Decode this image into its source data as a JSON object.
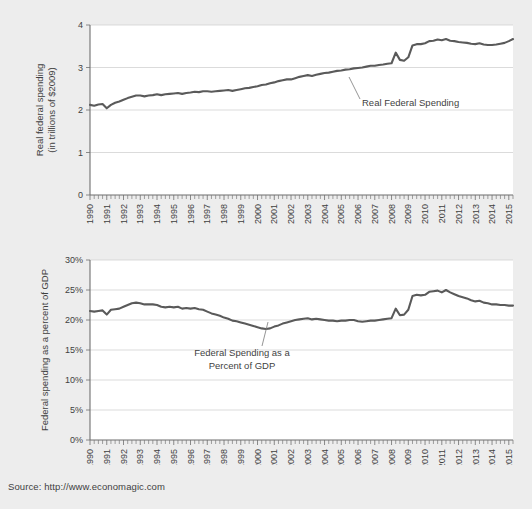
{
  "source": {
    "label": "Source: http://www.economagic.com"
  },
  "charts": [
    {
      "id": "real-federal-spending",
      "ylabel_line1": "Real federal spending",
      "ylabel_line2": "(in trillions of $2009)",
      "annotation_line1": "Real Federal Spending",
      "annotation_line2": "",
      "yticks": [
        "0",
        "1",
        "2",
        "3",
        "4"
      ],
      "xticks": [
        "1990",
        "1991",
        "1992",
        "1993",
        "1994",
        "1995",
        "1996",
        "1997",
        "1998",
        "1999",
        "2000",
        "2001",
        "2002",
        "2003",
        "2004",
        "2005",
        "2006",
        "2007",
        "2008",
        "2009",
        "2010",
        "2011",
        "2012",
        "2013",
        "2014",
        "2015"
      ]
    },
    {
      "id": "federal-spending-pct-gdp",
      "ylabel_line1": "Federal spending as a percent of GDP",
      "ylabel_line2": "",
      "annotation_line1": "Federal Spending as a",
      "annotation_line2": "Percent of GDP",
      "yticks": [
        "0%",
        "5%",
        "10%",
        "15%",
        "20%",
        "25%",
        "30%"
      ],
      "xticks": [
        "1990",
        "1991",
        "1992",
        "1993",
        "1994",
        "1995",
        "1996",
        "1997",
        "1998",
        "1999",
        "2000",
        "2001",
        "2002",
        "2003",
        "2004",
        "2005",
        "2006",
        "2007",
        "2008",
        "2009",
        "2010",
        "2011",
        "2012",
        "2013",
        "2014",
        "2015"
      ]
    }
  ],
  "chart_data": [
    {
      "type": "line",
      "title": "",
      "xlabel": "",
      "ylabel": "Real federal spending (in trillions of $2009)",
      "xlim": [
        1990,
        2015.25
      ],
      "ylim": [
        0,
        4
      ],
      "grid": true,
      "legend": "none",
      "annotations": [
        {
          "text": "Real Federal Spending",
          "x": 2006.0,
          "y": 2.52
        }
      ],
      "series": [
        {
          "name": "Real Federal Spending",
          "color": "#5a5a5a",
          "x": [
            1990.0,
            1990.25,
            1990.5,
            1990.75,
            1991.0,
            1991.25,
            1991.5,
            1991.75,
            1992.0,
            1992.25,
            1992.5,
            1992.75,
            1993.0,
            1993.25,
            1993.5,
            1993.75,
            1994.0,
            1994.25,
            1994.5,
            1994.75,
            1995.0,
            1995.25,
            1995.5,
            1995.75,
            1996.0,
            1996.25,
            1996.5,
            1996.75,
            1997.0,
            1997.25,
            1997.5,
            1997.75,
            1998.0,
            1998.25,
            1998.5,
            1998.75,
            1999.0,
            1999.25,
            1999.5,
            1999.75,
            2000.0,
            2000.25,
            2000.5,
            2000.75,
            2001.0,
            2001.25,
            2001.5,
            2001.75,
            2002.0,
            2002.25,
            2002.5,
            2002.75,
            2003.0,
            2003.25,
            2003.5,
            2003.75,
            2004.0,
            2004.25,
            2004.5,
            2004.75,
            2005.0,
            2005.25,
            2005.5,
            2005.75,
            2006.0,
            2006.25,
            2006.5,
            2006.75,
            2007.0,
            2007.25,
            2007.5,
            2007.75,
            2008.0,
            2008.25,
            2008.5,
            2008.75,
            2009.0,
            2009.25,
            2009.5,
            2009.75,
            2010.0,
            2010.25,
            2010.5,
            2010.75,
            2011.0,
            2011.25,
            2011.5,
            2011.75,
            2012.0,
            2012.25,
            2012.5,
            2012.75,
            2013.0,
            2013.25,
            2013.5,
            2013.75,
            2014.0,
            2014.25,
            2014.5,
            2014.75,
            2015.0,
            2015.25
          ],
          "y": [
            2.12,
            2.1,
            2.13,
            2.14,
            2.04,
            2.12,
            2.17,
            2.2,
            2.24,
            2.28,
            2.31,
            2.34,
            2.34,
            2.32,
            2.34,
            2.35,
            2.37,
            2.35,
            2.37,
            2.38,
            2.39,
            2.4,
            2.38,
            2.4,
            2.41,
            2.43,
            2.42,
            2.44,
            2.44,
            2.43,
            2.44,
            2.45,
            2.46,
            2.47,
            2.45,
            2.47,
            2.49,
            2.51,
            2.52,
            2.54,
            2.56,
            2.59,
            2.6,
            2.63,
            2.65,
            2.68,
            2.7,
            2.72,
            2.72,
            2.75,
            2.78,
            2.8,
            2.82,
            2.8,
            2.83,
            2.85,
            2.87,
            2.88,
            2.9,
            2.92,
            2.93,
            2.95,
            2.96,
            2.98,
            2.99,
            3.0,
            3.02,
            3.04,
            3.04,
            3.06,
            3.07,
            3.09,
            3.1,
            3.35,
            3.18,
            3.16,
            3.24,
            3.52,
            3.55,
            3.55,
            3.57,
            3.62,
            3.63,
            3.66,
            3.64,
            3.67,
            3.63,
            3.62,
            3.6,
            3.59,
            3.58,
            3.56,
            3.55,
            3.57,
            3.54,
            3.53,
            3.53,
            3.54,
            3.56,
            3.58,
            3.62,
            3.67
          ]
        }
      ]
    },
    {
      "type": "line",
      "title": "",
      "xlabel": "",
      "ylabel": "Federal spending as a percent of GDP",
      "xlim": [
        1990,
        2015.25
      ],
      "ylim": [
        0,
        30
      ],
      "grid": true,
      "legend": "none",
      "annotations": [
        {
          "text": "Federal Spending as a Percent of GDP",
          "x": 2002.0,
          "y": 13.5
        }
      ],
      "series": [
        {
          "name": "Federal Spending as a Percent of GDP",
          "color": "#5a5a5a",
          "x": [
            1990.0,
            1990.25,
            1990.5,
            1990.75,
            1991.0,
            1991.25,
            1991.5,
            1991.75,
            1992.0,
            1992.25,
            1992.5,
            1992.75,
            1993.0,
            1993.25,
            1993.5,
            1993.75,
            1994.0,
            1994.25,
            1994.5,
            1994.75,
            1995.0,
            1995.25,
            1995.5,
            1995.75,
            1996.0,
            1996.25,
            1996.5,
            1996.75,
            1997.0,
            1997.25,
            1997.5,
            1997.75,
            1998.0,
            1998.25,
            1998.5,
            1998.75,
            1999.0,
            1999.25,
            1999.5,
            1999.75,
            2000.0,
            2000.25,
            2000.5,
            2000.75,
            2001.0,
            2001.25,
            2001.5,
            2001.75,
            2002.0,
            2002.25,
            2002.5,
            2002.75,
            2003.0,
            2003.25,
            2003.5,
            2003.75,
            2004.0,
            2004.25,
            2004.5,
            2004.75,
            2005.0,
            2005.25,
            2005.5,
            2005.75,
            2006.0,
            2006.25,
            2006.5,
            2006.75,
            2007.0,
            2007.25,
            2007.5,
            2007.75,
            2008.0,
            2008.25,
            2008.5,
            2008.75,
            2009.0,
            2009.25,
            2009.5,
            2009.75,
            2010.0,
            2010.25,
            2010.5,
            2010.75,
            2011.0,
            2011.25,
            2011.5,
            2011.75,
            2012.0,
            2012.25,
            2012.5,
            2012.75,
            2013.0,
            2013.25,
            2013.5,
            2013.75,
            2014.0,
            2014.25,
            2014.5,
            2014.75,
            2015.0,
            2015.25
          ],
          "y": [
            21.5,
            21.4,
            21.5,
            21.6,
            20.9,
            21.7,
            21.8,
            21.9,
            22.2,
            22.5,
            22.8,
            22.9,
            22.8,
            22.6,
            22.6,
            22.6,
            22.5,
            22.2,
            22.1,
            22.2,
            22.1,
            22.2,
            21.9,
            22.0,
            21.9,
            22.0,
            21.8,
            21.7,
            21.4,
            21.1,
            20.9,
            20.7,
            20.4,
            20.2,
            19.9,
            19.8,
            19.6,
            19.4,
            19.2,
            19.0,
            18.8,
            18.6,
            18.5,
            18.6,
            18.9,
            19.1,
            19.4,
            19.6,
            19.8,
            20.0,
            20.1,
            20.2,
            20.3,
            20.1,
            20.2,
            20.1,
            20.0,
            19.9,
            19.9,
            19.8,
            19.9,
            19.9,
            20.0,
            20.0,
            19.8,
            19.7,
            19.8,
            19.9,
            19.9,
            20.0,
            20.1,
            20.2,
            20.3,
            21.9,
            20.8,
            20.9,
            21.7,
            24.0,
            24.2,
            24.1,
            24.2,
            24.7,
            24.8,
            24.9,
            24.6,
            25.0,
            24.6,
            24.3,
            24.0,
            23.8,
            23.6,
            23.3,
            23.1,
            23.2,
            22.9,
            22.8,
            22.6,
            22.6,
            22.5,
            22.5,
            22.4,
            22.4
          ]
        }
      ]
    }
  ]
}
